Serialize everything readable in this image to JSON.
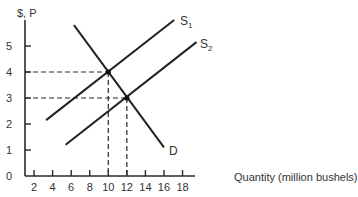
{
  "chart_data": {
    "type": "line",
    "title": "",
    "xlabel": "Quantity (million bushels)",
    "ylabel": "$, P",
    "xlim": [
      0,
      19
    ],
    "ylim": [
      0,
      6
    ],
    "x_ticks": [
      2,
      4,
      6,
      8,
      10,
      12,
      14,
      16,
      18
    ],
    "y_ticks": [
      0,
      1,
      2,
      3,
      4,
      5
    ],
    "grid": false,
    "legend": "inline labels at line ends",
    "series": [
      {
        "name": "S1",
        "label_main": "S",
        "label_sub": "1",
        "points": [
          [
            3.3,
            2.15
          ],
          [
            17.1,
            6.0
          ]
        ]
      },
      {
        "name": "S2",
        "label_main": "S",
        "label_sub": "2",
        "points": [
          [
            5.4,
            1.2
          ],
          [
            19.5,
            5.15
          ]
        ]
      },
      {
        "name": "D",
        "label_main": "D",
        "label_sub": "",
        "points": [
          [
            6.3,
            5.8
          ],
          [
            16.0,
            1.1
          ]
        ]
      }
    ],
    "equilibria": [
      {
        "name": "E1",
        "q": 10,
        "p": 4,
        "intersection_of": [
          "S1",
          "D"
        ]
      },
      {
        "name": "E2",
        "q": 12,
        "p": 3,
        "intersection_of": [
          "S2",
          "D"
        ]
      }
    ],
    "guides": "dashed lines from each equilibrium to both axes"
  },
  "axis": {
    "y_label": "$, P",
    "x_label": "Quantity (million bushels)",
    "y_tick_labels": [
      "0",
      "1",
      "2",
      "3",
      "4",
      "5"
    ],
    "x_tick_labels": [
      "2",
      "4",
      "6",
      "8",
      "10",
      "12",
      "14",
      "16",
      "18"
    ]
  },
  "labels": {
    "s1_main": "S",
    "s1_sub": "1",
    "s2_main": "S",
    "s2_sub": "2",
    "d": "D"
  }
}
